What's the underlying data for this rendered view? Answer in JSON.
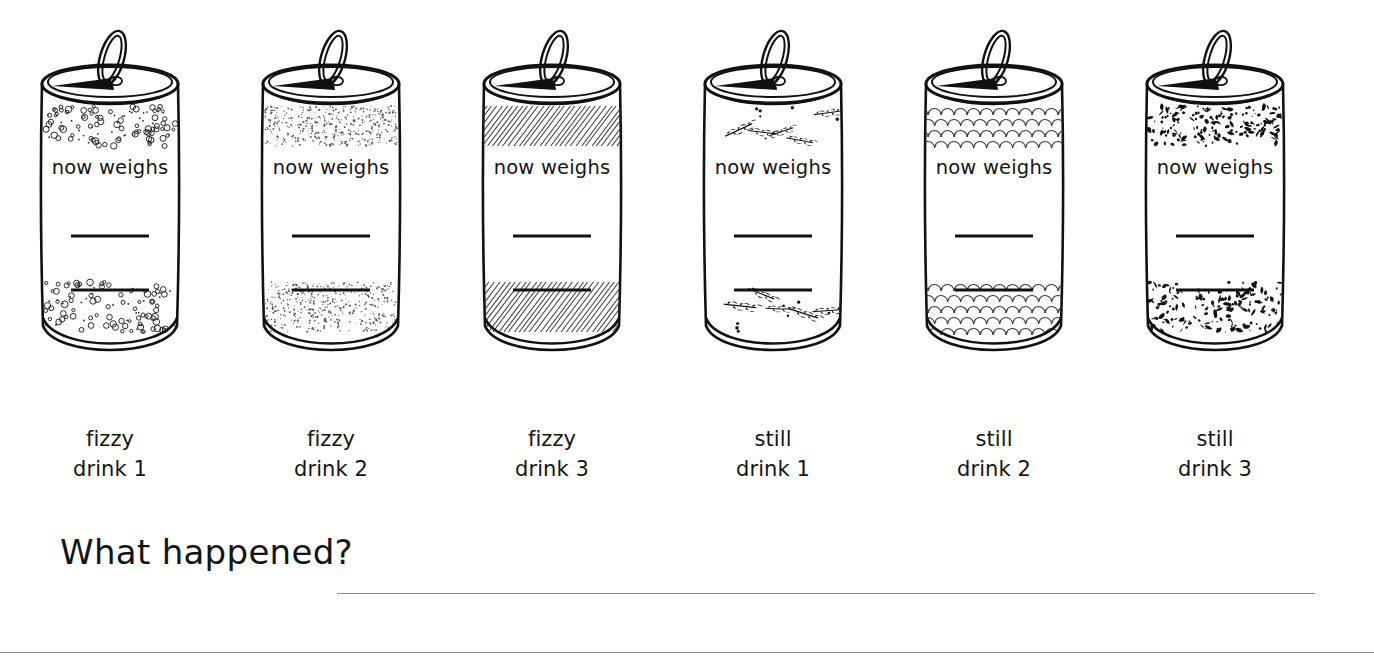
{
  "page": {
    "background_color": "#ffffff",
    "ink_color": "#141414",
    "rule_color": "#8a8a8a"
  },
  "cans": [
    {
      "id": "fizzy-drink-1",
      "can_text": "now weighs",
      "pattern": "small-bubbles",
      "caption_line_1": "fizzy",
      "caption_line_2": "drink 1",
      "write_lines": 2
    },
    {
      "id": "fizzy-drink-2",
      "can_text": "now weighs",
      "pattern": "fine-stipple",
      "caption_line_1": "fizzy",
      "caption_line_2": "drink 2",
      "write_lines": 2
    },
    {
      "id": "fizzy-drink-3",
      "can_text": "now weighs",
      "pattern": "diagonal-hatch",
      "caption_line_1": "fizzy",
      "caption_line_2": "drink 3",
      "write_lines": 2
    },
    {
      "id": "still-drink-1",
      "can_text": "now weighs",
      "pattern": "leaf-sprigs",
      "caption_line_1": "still",
      "caption_line_2": "drink 1",
      "write_lines": 2
    },
    {
      "id": "still-drink-2",
      "can_text": "now weighs",
      "pattern": "scallop-arcs",
      "caption_line_1": "still",
      "caption_line_2": "drink 2",
      "write_lines": 2
    },
    {
      "id": "still-drink-3",
      "can_text": "now weighs",
      "pattern": "coarse-speckle",
      "caption_line_1": "still",
      "caption_line_2": "drink 3",
      "write_lines": 2
    }
  ],
  "question": {
    "title": "What happened?",
    "answer_lines": 2
  }
}
